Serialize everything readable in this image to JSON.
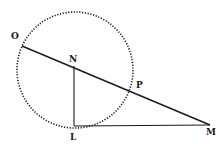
{
  "diagram": {
    "type": "geometric-figure",
    "colors": {
      "ink": "#1a1a1a",
      "background": "#ffffff"
    },
    "circle": {
      "cx": 75,
      "cy": 70,
      "r": 58,
      "style": "dotted"
    },
    "points": {
      "O": {
        "label": "O",
        "x": 22,
        "y": 46,
        "lx": 11,
        "ly": 39
      },
      "N": {
        "label": "N",
        "x": 74,
        "y": 66,
        "lx": 69,
        "ly": 62
      },
      "P": {
        "label": "P",
        "x": 131,
        "y": 91,
        "lx": 136,
        "ly": 88
      },
      "L": {
        "label": "L",
        "x": 74,
        "y": 126,
        "lx": 70,
        "ly": 140
      },
      "M": {
        "label": "M",
        "x": 210,
        "y": 125,
        "lx": 206,
        "ly": 135
      }
    },
    "segments": [
      {
        "name": "OM",
        "from": "O",
        "to": "M",
        "style": "solid"
      },
      {
        "name": "NL",
        "from": "N",
        "to": "L",
        "style": "solid"
      },
      {
        "name": "LM",
        "from": "L",
        "to": "M",
        "style": "solid"
      }
    ]
  }
}
